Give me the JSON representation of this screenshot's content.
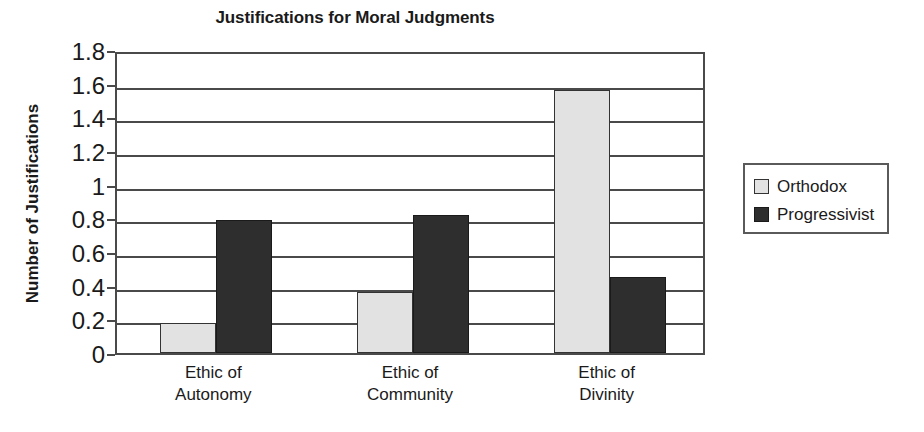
{
  "chart_data": {
    "type": "bar",
    "title": "Justifications for Moral Judgments",
    "xlabel": "",
    "ylabel": "Number of Justifications",
    "categories": [
      "Ethic of Autonomy",
      "Ethic of Community",
      "Ethic of Divinity"
    ],
    "category_lines": [
      [
        "Ethic of",
        "Autonomy"
      ],
      [
        "Ethic of",
        "Community"
      ],
      [
        "Ethic of",
        "Divinity"
      ]
    ],
    "series": [
      {
        "name": "Orthodox",
        "color": "#e2e2e2",
        "values": [
          0.18,
          0.36,
          1.56
        ]
      },
      {
        "name": "Progressivist",
        "color": "#2e2e2e",
        "values": [
          0.79,
          0.82,
          0.45
        ]
      }
    ],
    "ylim": [
      0,
      1.8
    ],
    "ytick_step": 0.2,
    "ytick_labels": [
      "1.8",
      "1.6",
      "1.4",
      "1.2",
      "1",
      "0.8",
      "0.6",
      "0.4",
      "0.2",
      "0"
    ],
    "ytick_values": [
      1.8,
      1.6,
      1.4,
      1.2,
      1.0,
      0.8,
      0.6,
      0.4,
      0.2,
      0
    ],
    "grid": true,
    "grid_axis": "y",
    "legend_position": "right",
    "legend_entries": [
      "Orthodox",
      "Progressivist"
    ],
    "plot_border_color": "#4a4a4a",
    "background_color": "#ffffff"
  }
}
